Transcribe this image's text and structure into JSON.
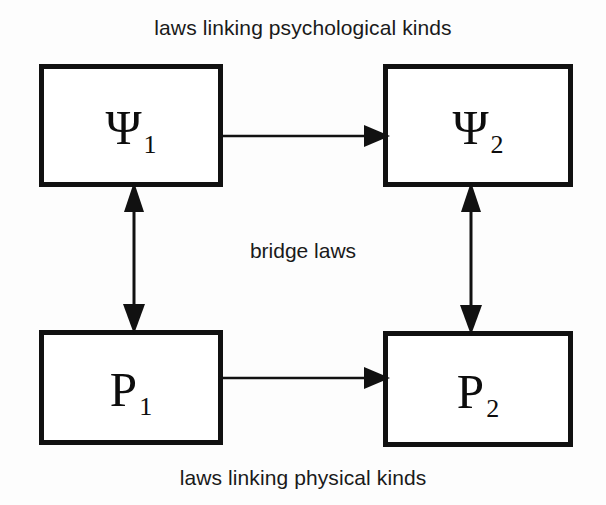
{
  "diagram": {
    "type": "block-diagram",
    "background_color": "#fdfdfd",
    "ink_color": "#111111",
    "captions": {
      "top": "laws linking psychological kinds",
      "middle": "bridge laws",
      "bottom": "laws linking physical kinds"
    },
    "nodes": [
      {
        "id": "psi1",
        "symbol": "Ψ",
        "subscript": "1",
        "row": "top",
        "column": "left"
      },
      {
        "id": "psi2",
        "symbol": "Ψ",
        "subscript": "2",
        "row": "top",
        "column": "right"
      },
      {
        "id": "p1",
        "symbol": "P",
        "subscript": "1",
        "row": "bottom",
        "column": "left"
      },
      {
        "id": "p2",
        "symbol": "P",
        "subscript": "2",
        "row": "bottom",
        "column": "right"
      }
    ],
    "edges": [
      {
        "id": "psi1-to-psi2",
        "from": "psi1",
        "to": "psi2",
        "direction": "single",
        "orientation": "horizontal",
        "meaning": "laws linking psychological kinds"
      },
      {
        "id": "p1-to-p2",
        "from": "p1",
        "to": "p2",
        "direction": "single",
        "orientation": "horizontal",
        "meaning": "laws linking physical kinds"
      },
      {
        "id": "psi1-p1-bridge",
        "from": "psi1",
        "to": "p1",
        "direction": "double",
        "orientation": "vertical",
        "meaning": "bridge laws"
      },
      {
        "id": "psi2-p2-bridge",
        "from": "psi2",
        "to": "p2",
        "direction": "double",
        "orientation": "vertical",
        "meaning": "bridge laws"
      }
    ]
  }
}
